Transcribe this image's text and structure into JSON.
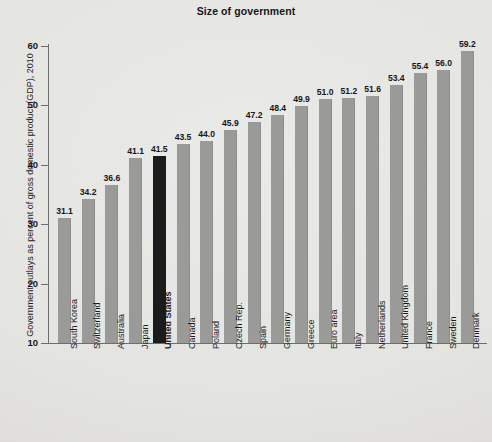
{
  "chart_data": {
    "type": "bar",
    "title": "Size of government",
    "xlabel": "",
    "ylabel": "Government outlays as percent of gross domestic product (GDP), 2010",
    "ylim": [
      10,
      60
    ],
    "yticks": [
      10,
      20,
      30,
      40,
      50,
      60
    ],
    "grid": false,
    "legend": "none",
    "bar_color": "#9a9a99",
    "highlight_color": "#1b1b1b",
    "highlight_category": "United States",
    "categories": [
      "South Korea",
      "Switzerland",
      "Australia",
      "Japan",
      "United States",
      "Canada",
      "Poland",
      "Czech Rep.",
      "Spain",
      "Germany",
      "Greece",
      "Euro area",
      "Italy",
      "Netherlands",
      "United Kingdom",
      "France",
      "Sweden",
      "Denmark"
    ],
    "values": [
      31.1,
      34.2,
      36.6,
      41.1,
      41.5,
      43.5,
      44.0,
      45.9,
      47.2,
      48.4,
      49.9,
      51.0,
      51.2,
      51.6,
      53.4,
      55.4,
      56.0,
      59.2
    ],
    "value_labels": [
      "31.1",
      "34.2",
      "36.6",
      "41.1",
      "41.5",
      "43.5",
      "44.0",
      "45.9",
      "47.2",
      "48.4",
      "49.9",
      "51.0",
      "51.2",
      "51.6",
      "53.4",
      "55.4",
      "56.0",
      "59.2"
    ],
    "ytick_labels": [
      "10",
      "20",
      "30",
      "40",
      "50",
      "60"
    ]
  }
}
